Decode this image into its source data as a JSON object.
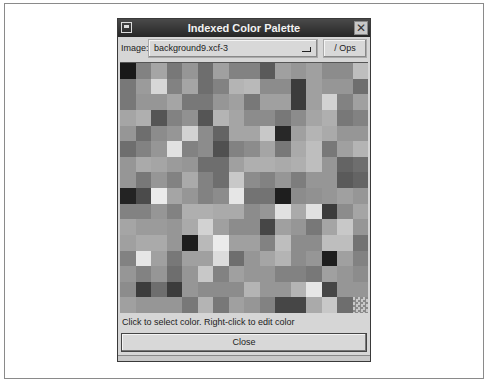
{
  "window": {
    "title": "Indexed Color Palette"
  },
  "toolbar": {
    "image_label": "Image:",
    "image_value": "background9.xcf-3",
    "ops_label": "/ Ops"
  },
  "palette": {
    "rows": 16,
    "cols": 16,
    "grays": [
      [
        25,
        130,
        165,
        120,
        150,
        110,
        160,
        130,
        130,
        90,
        160,
        150,
        160,
        140,
        140,
        190
      ],
      [
        120,
        155,
        215,
        130,
        165,
        110,
        130,
        180,
        185,
        140,
        140,
        60,
        160,
        150,
        150,
        110
      ],
      [
        120,
        150,
        150,
        165,
        120,
        120,
        150,
        160,
        120,
        160,
        160,
        60,
        160,
        210,
        130,
        160
      ],
      [
        165,
        175,
        85,
        130,
        145,
        85,
        180,
        165,
        140,
        140,
        120,
        140,
        165,
        175,
        120,
        130
      ],
      [
        150,
        110,
        140,
        150,
        210,
        140,
        100,
        165,
        165,
        200,
        40,
        160,
        180,
        170,
        150,
        150
      ],
      [
        110,
        130,
        150,
        225,
        130,
        140,
        80,
        130,
        140,
        165,
        120,
        170,
        190,
        120,
        160,
        180
      ],
      [
        150,
        170,
        165,
        155,
        150,
        110,
        110,
        160,
        175,
        175,
        170,
        175,
        190,
        150,
        100,
        110
      ],
      [
        150,
        120,
        150,
        130,
        170,
        130,
        110,
        200,
        140,
        130,
        150,
        125,
        150,
        150,
        90,
        100
      ],
      [
        35,
        75,
        235,
        165,
        150,
        130,
        140,
        230,
        115,
        115,
        30,
        140,
        145,
        150,
        160,
        150
      ],
      [
        130,
        130,
        150,
        130,
        175,
        175,
        170,
        170,
        140,
        150,
        225,
        170,
        225,
        60,
        140,
        165
      ],
      [
        165,
        155,
        155,
        150,
        170,
        210,
        160,
        140,
        140,
        70,
        160,
        150,
        120,
        165,
        200,
        150
      ],
      [
        160,
        170,
        170,
        150,
        30,
        185,
        235,
        160,
        160,
        130,
        190,
        140,
        140,
        190,
        190,
        115
      ],
      [
        130,
        230,
        160,
        120,
        160,
        160,
        220,
        110,
        150,
        165,
        180,
        140,
        150,
        30,
        160,
        130
      ],
      [
        150,
        130,
        150,
        110,
        150,
        200,
        130,
        160,
        150,
        150,
        130,
        130,
        120,
        160,
        150,
        140
      ],
      [
        140,
        60,
        110,
        60,
        150,
        140,
        140,
        140,
        180,
        150,
        150,
        180,
        230,
        70,
        150,
        150
      ],
      [
        160,
        150,
        150,
        150,
        120,
        180,
        120,
        160,
        150,
        130,
        70,
        70,
        170,
        200,
        110,
        -1
      ]
    ]
  },
  "status": {
    "hint": "Click to select color.  Right-click to edit color"
  },
  "buttons": {
    "close_label": "Close"
  }
}
